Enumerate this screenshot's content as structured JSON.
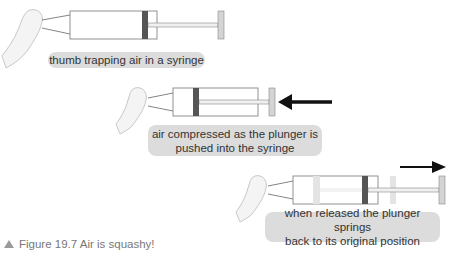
{
  "panels": [
    {
      "label": "thumb trapping air in a syringe"
    },
    {
      "label_line1": "air compressed as the plunger is",
      "label_line2": "pushed into the syringe"
    },
    {
      "label_line1": "when released the plunger springs",
      "label_line2": "back to its original position"
    }
  ],
  "caption": {
    "icon": "triangle-up",
    "text": "Figure 19.7 Air is squashy!"
  },
  "colors": {
    "label_bg": "#dcdcdc",
    "plunger_dark": "#555555",
    "handle": "#d4d4d4",
    "ghost": "#e4e4e4",
    "arrow": "#111111"
  }
}
